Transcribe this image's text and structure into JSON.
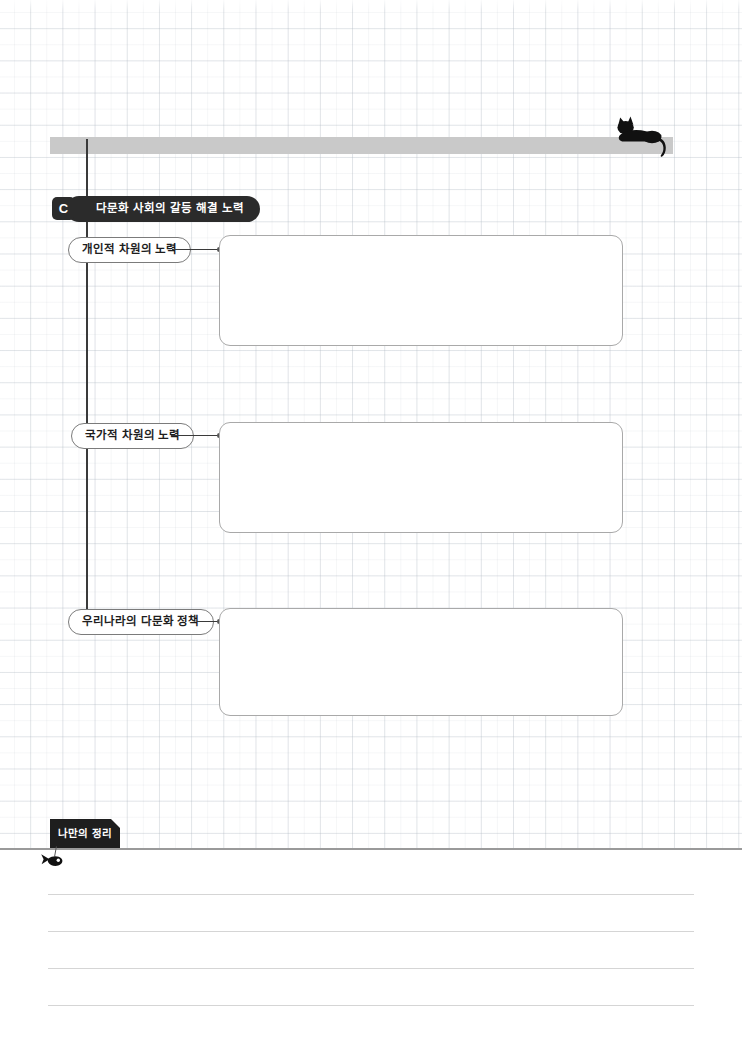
{
  "page": {
    "width": 742,
    "height": 1044,
    "background_color": "#ffffff",
    "grid_line_color": "#b2bac4",
    "accent_dark": "#2b2b2b",
    "bar_color": "#c9c9c9",
    "box_border_color": "#a9a9a9"
  },
  "header": {
    "bar_label": "",
    "cat_icon": "cat-silhouette-icon"
  },
  "section": {
    "badge": "C",
    "title": "다문화 사회의 갈등 해결 노력"
  },
  "branches": [
    {
      "label": "개인적 차원의 노력",
      "answer_value": "",
      "answer_placeholder": ""
    },
    {
      "label": "국가적 차원의 노력",
      "answer_value": "",
      "answer_placeholder": ""
    },
    {
      "label": "우리나라의 다문화 정책",
      "answer_value": "",
      "answer_placeholder": ""
    }
  ],
  "notes": {
    "tab_label": "나만의 정리",
    "fish_icon": "fish-silhouette-icon",
    "lines": [
      "",
      "",
      "",
      ""
    ]
  }
}
